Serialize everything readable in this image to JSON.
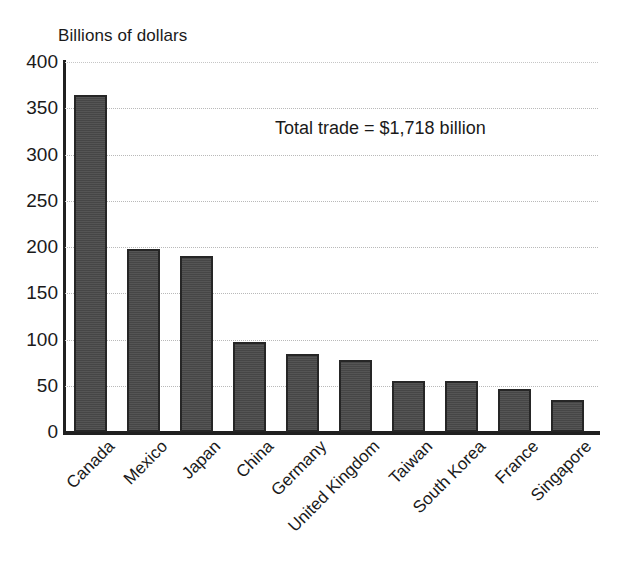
{
  "figure": {
    "y_axis_title": "Billions of dollars",
    "annotation": "Total trade = $1,718 billion"
  },
  "axis": {
    "y_ticks": [
      "0",
      "50",
      "100",
      "150",
      "200",
      "250",
      "300",
      "350",
      "400"
    ]
  },
  "chart_data": {
    "type": "bar",
    "title": "",
    "subtitle": "",
    "xlabel": "",
    "ylabel": "Billions of dollars",
    "ylim": [
      0,
      400
    ],
    "ytick_values": [
      0,
      50,
      100,
      150,
      200,
      250,
      300,
      350,
      400
    ],
    "grid": true,
    "legend": "none",
    "orientation": "vertical",
    "bar_color": "#4a4a4a",
    "bar_edge_color": "#262626",
    "annotations": [
      "Total trade = $1,718 billion"
    ],
    "categories": [
      "Canada",
      "Mexico",
      "Japan",
      "China",
      "Germany",
      "United Kingdom",
      "Taiwan",
      "South Korea",
      "France",
      "Singapore"
    ],
    "values": [
      364,
      198,
      190,
      97,
      84,
      78,
      55,
      55,
      47,
      35
    ],
    "units": "billions of dollars"
  }
}
